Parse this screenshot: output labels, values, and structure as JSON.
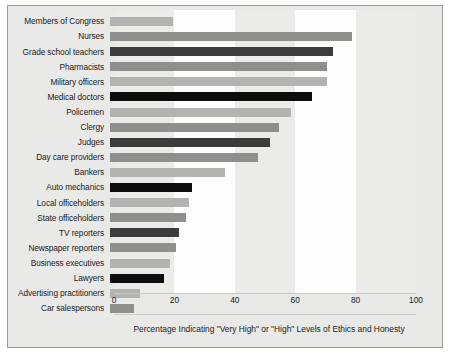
{
  "chart_data": {
    "type": "bar",
    "orientation": "horizontal",
    "title": "",
    "xlabel": "Percentage Indicating \"Very High\" or \"High\" Levels of Ethics and Honesty",
    "ylabel": "",
    "xlim": [
      0,
      100
    ],
    "xticks": [
      0,
      20,
      40,
      60,
      80,
      100
    ],
    "grid": false,
    "legend": null,
    "categories": [
      "Members of Congress",
      "Nurses",
      "Grade school teachers",
      "Pharmacists",
      "Military officers",
      "Medical doctors",
      "Policemen",
      "Clergy",
      "Judges",
      "Day care providers",
      "Bankers",
      "Auto mechanics",
      "Local officeholders",
      "State officeholders",
      "TV reporters",
      "Newspaper reporters",
      "Business executives",
      "Lawyers",
      "Advertising practitioners",
      "Car salespersons"
    ],
    "values": [
      21,
      80,
      74,
      72,
      72,
      67,
      60,
      56,
      53,
      49,
      38,
      27,
      26,
      25,
      23,
      22,
      20,
      18,
      10,
      8
    ],
    "bar_colors": [
      "#b3b3b1",
      "#8f8f8d",
      "#3c3c3c",
      "#8f8f8d",
      "#b3b3b1",
      "#0d0d0d",
      "#b3b3b1",
      "#8f8f8d",
      "#3c3c3c",
      "#8f8f8d",
      "#b3b3b1",
      "#0d0d0d",
      "#b3b3b1",
      "#8f8f8d",
      "#3c3c3c",
      "#8f8f8d",
      "#b3b3b1",
      "#0d0d0d",
      "#b3b3b1",
      "#8f8f8d"
    ]
  },
  "style": {
    "frame_background": "#e9e9e7",
    "frame_border": "#9a9a96",
    "band_white": "#fdfdfd",
    "band_tint": "#ebebe9",
    "axis_line": "#c9c9c5",
    "text_color": "#1b1b1b"
  }
}
